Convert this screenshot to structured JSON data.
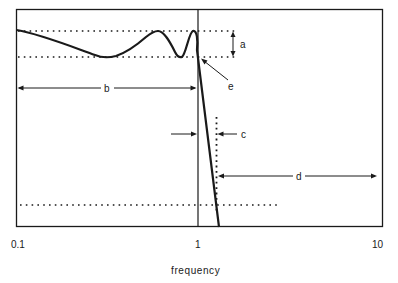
{
  "figure": {
    "type": "filter-response-diagram",
    "colors": {
      "line": "#1a1a1a",
      "background": "#ffffff"
    }
  },
  "axes": {
    "x_title": "frequency",
    "x_scale": "log",
    "x_ticks": [
      {
        "label": "0.1",
        "value": 0.1
      },
      {
        "label": "1",
        "value": 1
      },
      {
        "label": "10",
        "value": 10
      }
    ]
  },
  "annotations": {
    "a": {
      "label": "a",
      "meaning": "passband ripple band between upper and lower dotted lines"
    },
    "b": {
      "label": "b",
      "meaning": "passband extent from 0.1 to 1"
    },
    "c": {
      "label": "c",
      "meaning": "transition band width between f=1 and stopband edge"
    },
    "d": {
      "label": "d",
      "meaning": "stopband extent from stopband edge to 10"
    },
    "e": {
      "label": "e",
      "meaning": "point where response crosses lower ripple bound at passband edge"
    }
  },
  "lines": {
    "passband_upper_dotted": "upper ripple limit",
    "passband_lower_dotted": "lower ripple limit",
    "stopband_dotted": "stopband attenuation level",
    "cutoff_vertical": "passband edge at f = 1",
    "stopband_edge_dotted": "stopband edge frequency"
  }
}
